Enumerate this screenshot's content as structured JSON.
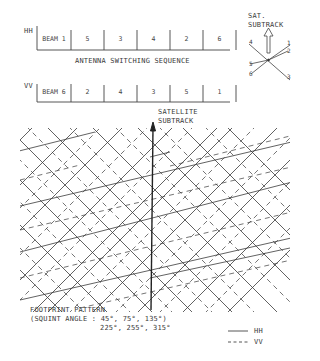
{
  "hh_sequence": {
    "label": "HH",
    "cells": [
      "BEAM 1",
      "5",
      "3",
      "4",
      "2",
      "6"
    ]
  },
  "sequence_title": "ANTENNA SWITCHING SEQUENCE",
  "vv_sequence": {
    "label": "VV",
    "cells": [
      "BEAM 6",
      "2",
      "4",
      "3",
      "5",
      "1"
    ]
  },
  "beam_rosette": {
    "title_line1": "SAT.",
    "title_line2": "SUBTRACK",
    "beams": [
      "1",
      "2",
      "3",
      "4",
      "5",
      "6"
    ]
  },
  "satellite_subtrack": {
    "line1": "SATELLITE",
    "line2": "SUBTRACK"
  },
  "caption": {
    "line1": "FOOTPRINT PATTERN",
    "line2": "(SQUINT ANGLE : 45°, 75°, 135°)",
    "line3": "225°, 255°, 315°"
  },
  "legend": [
    {
      "style": "solid",
      "label": "HH"
    },
    {
      "style": "dashed",
      "label": "VV"
    }
  ],
  "colors": {
    "ink": "#3a3a3a",
    "background": "#ffffff"
  }
}
